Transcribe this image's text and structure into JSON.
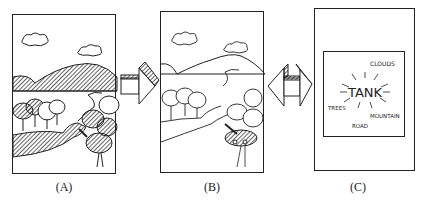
{
  "figure": {
    "panels": [
      {
        "id": "A",
        "caption": "(A)",
        "description": "shaded landscape drawing"
      },
      {
        "id": "B",
        "caption": "(B)",
        "description": "line drawing of landscape with tank"
      },
      {
        "id": "C",
        "caption": "(C)",
        "description": "semantic word map"
      }
    ],
    "panel_c_words": {
      "center": "TANK",
      "clouds": "CLOUDS",
      "trees": "TREES",
      "mountain": "MOUNTAIN",
      "road": "ROAD"
    },
    "arrows": [
      {
        "from": "A",
        "to": "B",
        "direction": "right"
      },
      {
        "from": "C",
        "to": "B",
        "direction": "left"
      }
    ]
  }
}
